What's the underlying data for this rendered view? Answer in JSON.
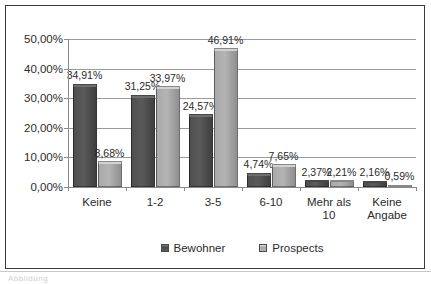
{
  "chart_data": {
    "type": "bar",
    "title": "",
    "xlabel": "",
    "ylabel": "",
    "categories": [
      "Keine",
      "1-2",
      "3-5",
      "6-10",
      "Mehr als 10",
      "Keine Angabe"
    ],
    "category_lines": [
      [
        "Keine"
      ],
      [
        "1-2"
      ],
      [
        "3-5"
      ],
      [
        "6-10"
      ],
      [
        "Mehr als",
        "10"
      ],
      [
        "Keine",
        "Angabe"
      ]
    ],
    "series": [
      {
        "name": "Bewohner",
        "color": "#4f4f4f",
        "values": [
          34.91,
          31.25,
          24.57,
          4.74,
          2.37,
          2.16
        ],
        "labels": [
          "34,91%",
          "31,25%",
          "24,57%",
          "4,74%",
          "2,37%",
          "2,16%"
        ]
      },
      {
        "name": "Prospects",
        "color": "#a9a9a9",
        "values": [
          8.68,
          33.97,
          46.91,
          7.65,
          2.21,
          0.59
        ],
        "labels": [
          "8,68%",
          "33,97%",
          "46,91%",
          "7,65%",
          "2,21%",
          "0,59%"
        ]
      }
    ],
    "ylim": [
      0,
      50
    ],
    "ytick_values": [
      0,
      10,
      20,
      30,
      40,
      50
    ],
    "ytick_labels": [
      "0,00%",
      "10,00%",
      "20,00%",
      "30,00%",
      "40,00%",
      "50,00%"
    ],
    "grid": true,
    "legend_position": "bottom",
    "legend": [
      "Bewohner",
      "Prospects"
    ]
  },
  "caption": {
    "fragment": "Abbildung"
  }
}
